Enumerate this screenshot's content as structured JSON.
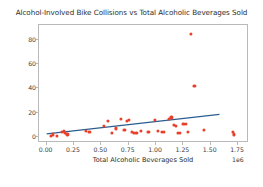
{
  "chart_data": {
    "type": "scatter",
    "title": "Alcohol-Involved Bike Collisions vs Total Alcoholic Beverages Sold",
    "xlabel": "Total Alcoholic Beverages Sold",
    "ylabel": "Point Count",
    "x_exponent_label": "1e6",
    "x_tick_labels": [
      "0.00",
      "0.25",
      "0.50",
      "0.75",
      "1.00",
      "1.25",
      "1.50",
      "1.75"
    ],
    "x_tick_values": [
      0.0,
      0.25,
      0.5,
      0.75,
      1.0,
      1.25,
      1.5,
      1.75
    ],
    "y_tick_labels": [
      "0",
      "20",
      "40",
      "60",
      "80"
    ],
    "y_tick_values": [
      0,
      20,
      40,
      60,
      80
    ],
    "xlim": [
      -0.07,
      1.85
    ],
    "ylim": [
      -5,
      92
    ],
    "grid": false,
    "legend": null,
    "point_color": "#e8402a",
    "trend_color": "#2a5d8f",
    "frame_color": "#b9b9b9",
    "points": [
      {
        "x": 0.04,
        "y": 1
      },
      {
        "x": 0.06,
        "y": 2
      },
      {
        "x": 0.09,
        "y": 1
      },
      {
        "x": 0.14,
        "y": 4
      },
      {
        "x": 0.16,
        "y": 5
      },
      {
        "x": 0.17,
        "y": 3
      },
      {
        "x": 0.19,
        "y": 2
      },
      {
        "x": 0.36,
        "y": 5
      },
      {
        "x": 0.39,
        "y": 4
      },
      {
        "x": 0.52,
        "y": 9
      },
      {
        "x": 0.56,
        "y": 13
      },
      {
        "x": 0.6,
        "y": 3
      },
      {
        "x": 0.63,
        "y": 7
      },
      {
        "x": 0.68,
        "y": 15
      },
      {
        "x": 0.71,
        "y": 6
      },
      {
        "x": 0.73,
        "y": 13
      },
      {
        "x": 0.75,
        "y": 14
      },
      {
        "x": 0.78,
        "y": 4
      },
      {
        "x": 0.8,
        "y": 3
      },
      {
        "x": 0.82,
        "y": 3
      },
      {
        "x": 0.86,
        "y": 5
      },
      {
        "x": 0.93,
        "y": 4
      },
      {
        "x": 0.99,
        "y": 14
      },
      {
        "x": 1.02,
        "y": 5
      },
      {
        "x": 1.05,
        "y": 4
      },
      {
        "x": 1.07,
        "y": 4
      },
      {
        "x": 1.12,
        "y": 15
      },
      {
        "x": 1.14,
        "y": 16
      },
      {
        "x": 1.16,
        "y": 10
      },
      {
        "x": 1.18,
        "y": 9
      },
      {
        "x": 1.2,
        "y": 3
      },
      {
        "x": 1.22,
        "y": 3
      },
      {
        "x": 1.25,
        "y": 11
      },
      {
        "x": 1.27,
        "y": 11
      },
      {
        "x": 1.29,
        "y": 4
      },
      {
        "x": 1.32,
        "y": 85
      },
      {
        "x": 1.35,
        "y": 42
      },
      {
        "x": 1.44,
        "y": 6
      },
      {
        "x": 1.7,
        "y": 4
      },
      {
        "x": 1.71,
        "y": 2
      }
    ],
    "trend_line": {
      "x0": 0.0,
      "y0": 2.5,
      "x1": 1.58,
      "y1": 18.5
    }
  }
}
